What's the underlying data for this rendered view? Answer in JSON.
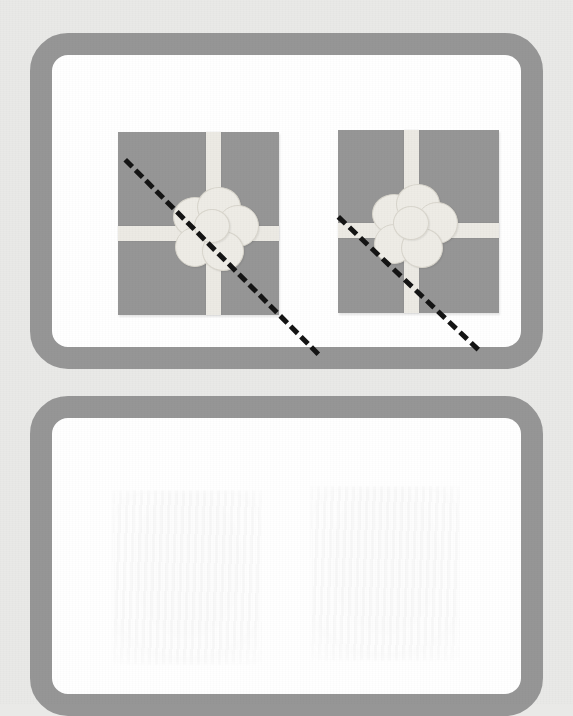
{
  "page": {
    "background_color": "#e9e9e7",
    "type": "symmetry-worksheet"
  },
  "panels": [
    {
      "id": "top-panel",
      "role": "figure-panel",
      "label": "Gift boxes with dashed lines",
      "frame_color": "#969696",
      "fill_color": "#ffffff",
      "border_width": 22,
      "corner_radius": 38
    },
    {
      "id": "bottom-panel",
      "role": "answer-panel",
      "label": "Empty answer area",
      "frame_color": "#969696",
      "fill_color": "#ffffff",
      "border_width": 22,
      "corner_radius": 38,
      "content": ""
    }
  ],
  "figures": [
    {
      "id": "gift-1",
      "name": "Gift box 1",
      "box_color": "#969696",
      "ribbon_color": "#eceae4",
      "bow_color": "#eeece6",
      "ribbon_vertical_offset_pct": 55,
      "ribbon_horizontal_offset_pct": 51,
      "dashed_line": {
        "id": "symmetry-line-1",
        "label": "Dashed diagonal line 1",
        "color": "#141414",
        "style": "dashed",
        "thickness": 5,
        "angle_deg": 45.2,
        "direction": "top-left to bottom-right"
      }
    },
    {
      "id": "gift-2",
      "name": "Gift box 2",
      "box_color": "#969696",
      "ribbon_color": "#eceae4",
      "bow_color": "#eeece6",
      "ribbon_vertical_offset_pct": 41,
      "ribbon_horizontal_offset_pct": 51,
      "dashed_line": {
        "id": "symmetry-line-2",
        "label": "Dashed diagonal line 2",
        "color": "#141414",
        "style": "dashed",
        "thickness": 5,
        "angle_deg": 43.5,
        "direction": "top-left to bottom-right"
      }
    }
  ],
  "ghosts": [
    {
      "id": "ghost-left",
      "label": "Faint bleed-through of gift box 1"
    },
    {
      "id": "ghost-right",
      "label": "Faint bleed-through of gift box 2"
    }
  ]
}
